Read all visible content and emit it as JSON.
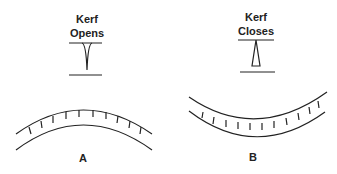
{
  "diagram": {
    "panel_a": {
      "label": "A",
      "caption_line1": "Kerf",
      "caption_line2": "Opens"
    },
    "panel_b": {
      "label": "B",
      "caption_line1": "Kerf",
      "caption_line2": "Closes"
    },
    "stroke_color": "#222222"
  }
}
